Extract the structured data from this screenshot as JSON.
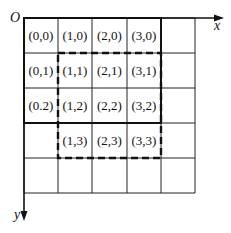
{
  "diagram": {
    "origin_label": "O",
    "x_axis_label": "x",
    "y_axis_label": "y",
    "grid": {
      "columns": 5,
      "rows": 5
    },
    "cells": [
      {
        "col": 0,
        "row": 0,
        "label": "(0,0)"
      },
      {
        "col": 1,
        "row": 0,
        "label": "(1,0)"
      },
      {
        "col": 2,
        "row": 0,
        "label": "(2,0)"
      },
      {
        "col": 3,
        "row": 0,
        "label": "(3,0)"
      },
      {
        "col": 0,
        "row": 1,
        "label": "(0,1)"
      },
      {
        "col": 1,
        "row": 1,
        "label": "(1,1)"
      },
      {
        "col": 2,
        "row": 1,
        "label": "(2,1)"
      },
      {
        "col": 3,
        "row": 1,
        "label": "(3,1)"
      },
      {
        "col": 0,
        "row": 2,
        "label": "(0.2)"
      },
      {
        "col": 1,
        "row": 2,
        "label": "(1,2)"
      },
      {
        "col": 2,
        "row": 2,
        "label": "(2,2)"
      },
      {
        "col": 3,
        "row": 2,
        "label": "(3,2)"
      },
      {
        "col": 1,
        "row": 3,
        "label": "(1,3)"
      },
      {
        "col": 2,
        "row": 3,
        "label": "(2,3)"
      },
      {
        "col": 3,
        "row": 3,
        "label": "(3,3)"
      }
    ],
    "solid_region": {
      "col_start": 0,
      "col_end": 3,
      "row_start": 0,
      "row_end": 2
    },
    "dashed_region": {
      "col_start": 1,
      "col_end": 3,
      "row_start": 1,
      "row_end": 3
    }
  }
}
